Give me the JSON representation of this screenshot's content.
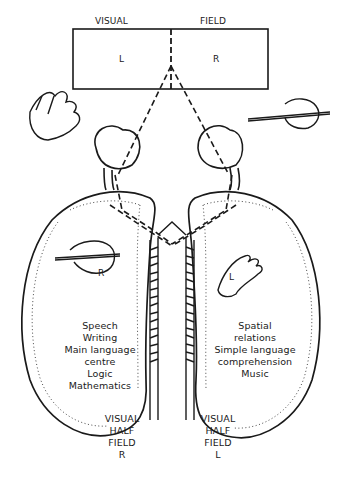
{
  "visual_field": {
    "left_header": "VISUAL",
    "right_header": "FIELD",
    "left_half": "L",
    "right_half": "R"
  },
  "left_hemisphere": {
    "hand_label": "R",
    "functions": [
      "Speech",
      "Writing",
      "Main language",
      "centre",
      "Logic",
      "Mathematics"
    ],
    "half_field": [
      "VISUAL",
      "HALF",
      "FIELD",
      "R"
    ]
  },
  "right_hemisphere": {
    "hand_label": "L",
    "functions": [
      "Spatial",
      "relations",
      "Simple language",
      "comprehension",
      "Music"
    ],
    "half_field": [
      "VISUAL",
      "HALF",
      "FIELD",
      "L"
    ]
  },
  "colors": {
    "ink": "#1a1a1a",
    "background": "#ffffff"
  }
}
